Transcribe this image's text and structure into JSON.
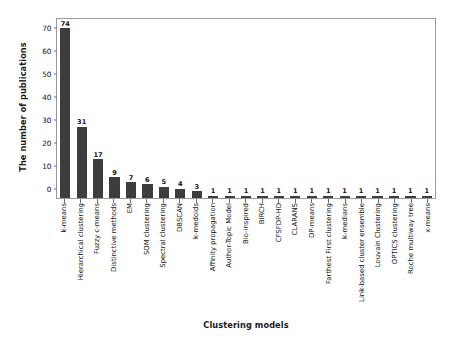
{
  "chart_data": {
    "type": "bar",
    "title": "",
    "xlabel": "Clustering models",
    "ylabel": "The number of publications",
    "ylim": [
      0,
      78
    ],
    "yticks": [
      0,
      10,
      20,
      30,
      40,
      50,
      60,
      70
    ],
    "grid": false,
    "legend": null,
    "bar_color": "#3d3d3d",
    "value_labels": true,
    "categories": [
      "k-means",
      "Hierarchical clustering",
      "Fuzzy c-means",
      "Distinctive methods",
      "EM",
      "SOM clustering",
      "Spectral clustering",
      "DBSCAN",
      "k-medoids",
      "Affinity propagation",
      "Author-Topic Model",
      "Bio-inspired",
      "BIRCH",
      "CFSFDP-HD",
      "CLARANS",
      "DP-means",
      "Farthest First clustering",
      "k-medians",
      "Link-based cluster ensemble",
      "Louvain Clustering",
      "OPTICS clustering",
      "Roche multiway tree",
      "x-means"
    ],
    "values": [
      74,
      31,
      17,
      9,
      7,
      6,
      5,
      4,
      3,
      1,
      1,
      1,
      1,
      1,
      1,
      1,
      1,
      1,
      1,
      1,
      1,
      1,
      1
    ]
  }
}
